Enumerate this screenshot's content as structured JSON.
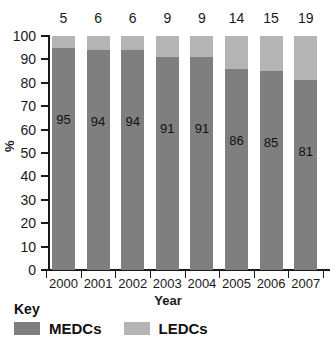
{
  "chart_data": {
    "type": "bar",
    "subtype": "stacked-100-percent",
    "title": "",
    "xlabel": "Year",
    "ylabel": "%",
    "categories": [
      "2000",
      "2001",
      "2002",
      "2003",
      "2004",
      "2005",
      "2006",
      "2007"
    ],
    "series": [
      {
        "name": "MEDCs",
        "color": "#7f7f7f",
        "values": [
          95,
          94,
          94,
          91,
          91,
          86,
          85,
          81
        ],
        "labels_inside_bars": true
      },
      {
        "name": "LEDCs",
        "color": "#b4b4b4",
        "values": [
          5,
          6,
          6,
          9,
          9,
          14,
          15,
          19
        ],
        "labels_above_bars": true
      }
    ],
    "ylim": [
      0,
      100
    ],
    "yticks": [
      0,
      10,
      20,
      30,
      40,
      50,
      60,
      70,
      80,
      90,
      100
    ],
    "ytick_labels": [
      "0",
      "10",
      "20",
      "30",
      "40",
      "50",
      "60",
      "70",
      "80",
      "90",
      "100"
    ],
    "grid": false,
    "legend_position": "bottom-left"
  },
  "legend": {
    "title": "Key",
    "items": [
      {
        "label": "MEDCs",
        "color": "#7f7f7f"
      },
      {
        "label": "LEDCs",
        "color": "#b4b4b4"
      }
    ]
  },
  "axes": {
    "x_title": "Year",
    "y_title": "%"
  }
}
